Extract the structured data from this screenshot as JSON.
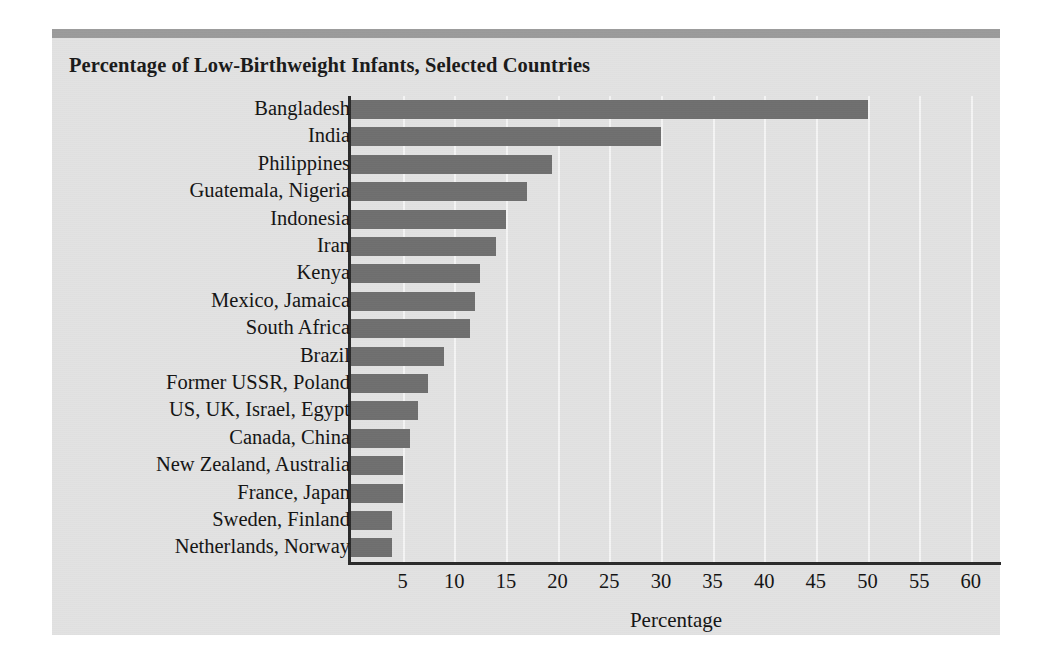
{
  "chart_data": {
    "type": "bar",
    "orientation": "horizontal",
    "title": "Percentage of Low-Birthweight Infants, Selected Countries",
    "xlabel": "Percentage",
    "ylabel": "",
    "xlim": [
      0,
      62.9
    ],
    "xticks": [
      5,
      10,
      15,
      20,
      25,
      30,
      35,
      40,
      45,
      50,
      55,
      60
    ],
    "xtick_labels": [
      "5",
      "10",
      "15",
      "20",
      "25",
      "30",
      "35",
      "40",
      "45",
      "50",
      "55",
      "60"
    ],
    "grid": "vertical-white-gridlines",
    "legend": "none",
    "bar_color": "#6f6f6f",
    "plot_background": "#e2e2e2",
    "categories": [
      "Bangladesh",
      "India",
      "Philippines",
      "Guatemala, Nigeria",
      "Indonesia",
      "Iran",
      "Kenya",
      "Mexico, Jamaica",
      "South Africa",
      "Brazil",
      "Former USSR, Poland",
      "US, UK, Israel, Egypt",
      "Canada, China",
      "New Zealand, Australia",
      "France, Japan",
      "Sweden, Finland",
      "Netherlands, Norway"
    ],
    "values": [
      50,
      30,
      19.5,
      17,
      15,
      14,
      12.5,
      12,
      11.5,
      9,
      7.5,
      6.5,
      5.7,
      5,
      5,
      4,
      4
    ]
  }
}
